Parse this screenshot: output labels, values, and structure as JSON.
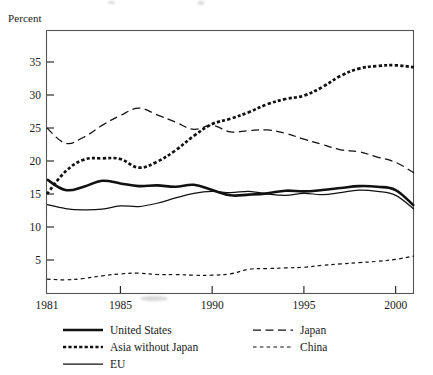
{
  "figure": {
    "name": "line-chart-gross-capital-formation-percent",
    "y_axis_title": "Percent"
  },
  "chart_data": {
    "type": "line",
    "title": "",
    "subtitle": "",
    "xlabel": "",
    "ylabel": "Percent",
    "xlim": [
      1981,
      2001
    ],
    "ylim": [
      0,
      38
    ],
    "grid": false,
    "legend_position": "below",
    "x_tick_labels": [
      "1981",
      "1985",
      "1990",
      "1995",
      "2000"
    ],
    "x_tick_values": [
      1981,
      1985,
      1990,
      1995,
      2000
    ],
    "y_tick_labels": [
      "5",
      "10",
      "15",
      "20",
      "25",
      "30",
      "35"
    ],
    "y_tick_values": [
      5,
      10,
      15,
      20,
      25,
      30,
      35
    ],
    "x": [
      1981,
      1982,
      1983,
      1984,
      1985,
      1986,
      1987,
      1988,
      1989,
      1990,
      1991,
      1992,
      1993,
      1994,
      1995,
      1996,
      1997,
      1998,
      1999,
      2000,
      2001
    ],
    "series": [
      {
        "name": "United States",
        "style": "thick-solid",
        "values": [
          17.2,
          15.6,
          16.1,
          17.0,
          16.6,
          16.2,
          16.3,
          16.1,
          16.4,
          15.6,
          14.8,
          14.9,
          15.1,
          15.5,
          15.4,
          15.6,
          15.9,
          16.2,
          16.1,
          15.6,
          13.2
        ]
      },
      {
        "name": "Asia without Japan",
        "style": "thick-dotted",
        "values": [
          15.0,
          18.4,
          20.2,
          20.4,
          20.3,
          19.0,
          19.9,
          21.6,
          23.8,
          25.6,
          26.4,
          27.4,
          28.6,
          29.4,
          29.9,
          31.2,
          32.9,
          34.0,
          34.4,
          34.5,
          34.2
        ]
      },
      {
        "name": "Japan",
        "style": "long-dash",
        "values": [
          25.0,
          22.7,
          23.6,
          25.4,
          26.9,
          28.0,
          27.0,
          25.9,
          24.8,
          25.4,
          24.4,
          24.6,
          24.7,
          24.2,
          23.3,
          22.5,
          21.7,
          21.4,
          20.6,
          19.8,
          18.2
        ]
      },
      {
        "name": "China",
        "style": "short-dash",
        "values": [
          2.1,
          2.0,
          2.2,
          2.6,
          2.9,
          3.0,
          2.8,
          2.8,
          2.7,
          2.7,
          2.9,
          3.6,
          3.7,
          3.8,
          3.9,
          4.2,
          4.4,
          4.6,
          4.8,
          5.1,
          5.6
        ]
      },
      {
        "name": "EU",
        "style": "thin-solid",
        "values": [
          13.4,
          12.8,
          12.6,
          12.7,
          13.2,
          13.1,
          13.6,
          14.4,
          15.1,
          15.4,
          15.2,
          15.4,
          15.0,
          14.8,
          15.1,
          14.9,
          15.2,
          15.6,
          15.4,
          14.8,
          12.7
        ]
      }
    ]
  },
  "legend": {
    "items": [
      {
        "label": "United States",
        "style": "thick-solid",
        "column": "left",
        "row": 0
      },
      {
        "label": "Asia without Japan",
        "style": "thick-dotted",
        "column": "left",
        "row": 1
      },
      {
        "label": "EU",
        "style": "thin-solid",
        "column": "left",
        "row": 2
      },
      {
        "label": "Japan",
        "style": "long-dash",
        "column": "right",
        "row": 0
      },
      {
        "label": "China",
        "style": "short-dash",
        "column": "right",
        "row": 1
      }
    ]
  },
  "colors": {
    "ink": "#111111",
    "frame": "#555555",
    "background": "#ffffff"
  }
}
